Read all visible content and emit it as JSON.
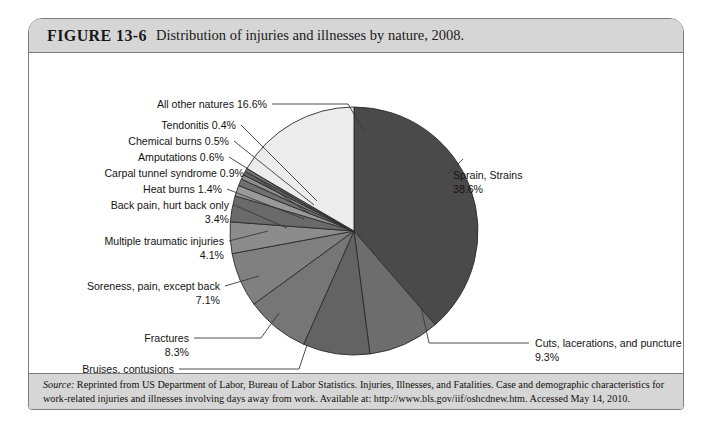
{
  "figure": {
    "number": "FIGURE 13-6",
    "caption": "Distribution of injuries and illnesses by nature, 2008."
  },
  "source": {
    "label": "Source:",
    "text": " Reprinted from US Department of Labor, Bureau of Labor Statistics. Injuries, Illnesses, and Fatalities. Case and demographic characteristics for work-related injuries and illnesses involving days away from work. Available at: http://www.bls.gov/iif/oshcdnew.htm. Accessed May 14, 2010."
  },
  "chart_data": {
    "type": "pie",
    "title": "Distribution of injuries and illnesses by nature, 2008.",
    "xlabel": "",
    "ylabel": "",
    "units": "percent",
    "start_angle_deg": 0,
    "direction": "clockwise",
    "legend": "none",
    "grid": false,
    "categories": [
      "Sprain, Strains",
      "Cuts, lacerations, and punctures",
      "Bruises, contusions",
      "Fractures",
      "Soreness, pain, except back",
      "Multiple traumatic injuries",
      "Back pain, hurt back only",
      "Heat burns",
      "Carpal tunnel syndrome",
      "Amputations",
      "Chemical burns",
      "Tendonitis",
      "All other natures"
    ],
    "values": [
      38.6,
      9.3,
      8.7,
      8.3,
      7.1,
      4.1,
      3.4,
      1.4,
      0.9,
      0.6,
      0.5,
      0.4,
      16.6
    ],
    "value_labels": [
      "38.6%",
      "9.3%",
      "8.7%",
      "8.3%",
      "7.1%",
      "4.1%",
      "3.4%",
      "1.4%",
      "0.9%",
      "0.6%",
      "0.5%",
      "0.4%",
      "16.6%"
    ],
    "colors": [
      "#4a4a4a",
      "#6d6d6d",
      "#636363",
      "#767676",
      "#808080",
      "#8c8c8c",
      "#6a6a6a",
      "#9a9a9a",
      "#707070",
      "#8f8f8f",
      "#626262",
      "#7b7b7b",
      "#ececec"
    ]
  },
  "labels": {
    "all_other_natures": {
      "name": "All other natures",
      "value": "16.6%",
      "line1": "All other natures 16.6%"
    },
    "tendonitis": {
      "name": "Tendonitis",
      "value": "0.4%",
      "line1": "Tendonitis 0.4%"
    },
    "chemical_burns": {
      "name": "Chemical burns",
      "value": "0.5%",
      "line1": "Chemical burns 0.5%"
    },
    "amputations": {
      "name": "Amputations",
      "value": "0.6%",
      "line1": "Amputations 0.6%"
    },
    "carpal_tunnel": {
      "name": "Carpal tunnel syndrome",
      "value": "0.9%",
      "line1": "Carpal tunnel syndrome 0.9%"
    },
    "heat_burns": {
      "name": "Heat burns",
      "value": "1.4%",
      "line1": "Heat burns 1.4%"
    },
    "back_pain": {
      "name": "Back pain, hurt back only",
      "value": "3.4%",
      "line1": "Back pain, hurt back only",
      "line2": "3.4%"
    },
    "multiple_traumatic": {
      "name": "Multiple traumatic injuries",
      "value": "4.1%",
      "line1": "Multiple traumatic injuries",
      "line2": "4.1%"
    },
    "soreness": {
      "name": "Soreness, pain, except back",
      "value": "7.1%",
      "line1": "Soreness, pain, except back",
      "line2": "7.1%"
    },
    "fractures": {
      "name": "Fractures",
      "value": "8.3%",
      "line1": "Fractures",
      "line2": "8.3%"
    },
    "bruises": {
      "name": "Bruises, contusions",
      "value": "8.7%",
      "line1": "Bruises, contusions",
      "line2": "8.7%"
    },
    "sprains": {
      "name": "Sprain, Strains",
      "value": "38.6%",
      "line1": "Sprain, Strains",
      "line2": "38.6%"
    },
    "cuts": {
      "name": "Cuts, lacerations, and punctures",
      "value": "9.3%",
      "line1": "Cuts, lacerations, and punctures",
      "line2": "9.3%"
    }
  }
}
